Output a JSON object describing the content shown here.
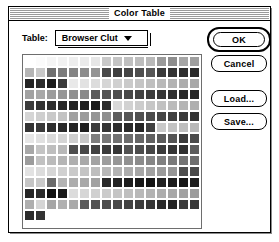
{
  "window": {
    "title": "Color Table"
  },
  "controls": {
    "table_label": "Table:",
    "popup_value": "Browser Clut",
    "popup_arrow_icon": "chevron-down-icon"
  },
  "buttons": {
    "ok": "OK",
    "cancel": "Cancel",
    "load": "Load...",
    "save": "Save..."
  },
  "colors": {
    "window_bg": "#ffffff",
    "frame": "#000000",
    "grid_border": "#6e6e6e",
    "titlebar_stripe": "#9b9b9b",
    "text": "#000000"
  },
  "swatch_grid": {
    "columns": 16,
    "rows": 15,
    "cell_size_px": 11,
    "total_swatches": 226,
    "palette_name": "Browser Clut",
    "values": [
      [
        "#ffffff",
        "#fbfbfb",
        "#f5f5f5",
        "#f2f2f2",
        "#eeeeee",
        "#ebebeb",
        "#e6e6e6",
        "#c9c9c9",
        "#c4c4c4",
        "#c0c0c0",
        "#bdbdbd",
        "#b9b9b9",
        "#9a9a9a",
        "#8e8e8e",
        "#a6a6a6",
        "#9f9f9f"
      ],
      [
        "#b5b5b5",
        "#c9c9c9",
        "#6f6f6f",
        "#7c7c7c",
        "#848484",
        "#8c8c8c",
        "#949494",
        "#4a4a4a",
        "#3f3f3f",
        "#464646",
        "#4e4e4e",
        "#565656",
        "#3a3a3a",
        "#343434",
        "#2f2f2f",
        "#2a2a2a"
      ],
      [
        "#242424",
        "#2c2c2c",
        "#1c1c1c",
        "#3b3b3b",
        "#e9e9e9",
        "#e2e2e2",
        "#dcdcdc",
        "#d6d6d6",
        "#d0d0d0",
        "#cacaca",
        "#c5c5c5",
        "#bfbfbf",
        "#b9b9b9",
        "#b3b3b3",
        "#adadad",
        "#a8a8a8"
      ],
      [
        "#a2a2a2",
        "#a9a9a9",
        "#9c9c9c",
        "#969696",
        "#909090",
        "#8a8a8a",
        "#5a5a5a",
        "#545454",
        "#4e4e4e",
        "#484848",
        "#434343",
        "#3d3d3d",
        "#373737",
        "#313131",
        "#2b2b2b",
        "#262626"
      ],
      [
        "#3c3c3c",
        "#333333",
        "#2e2e2e",
        "#292929",
        "#242424",
        "#1f1f1f",
        "#1a1a1a",
        "#2d2d2d",
        "#d8d8d8",
        "#d2d2d2",
        "#cccccc",
        "#c6c6c6",
        "#c1c1c1",
        "#bbbbbb",
        "#b5b5b5",
        "#afafaf"
      ],
      [
        "#d5d5d5",
        "#cfcfcf",
        "#c9c9c9",
        "#c3c3c3",
        "#a1a1a1",
        "#9b9b9b",
        "#959595",
        "#8f8f8f",
        "#5d5d5d",
        "#575757",
        "#515151",
        "#4c4c4c",
        "#464646",
        "#404040",
        "#3a3a3a",
        "#343434"
      ],
      [
        "#343434",
        "#3a3a3a",
        "#2f2f2f",
        "#2a2a2a",
        "#252525",
        "#202020",
        "#3b3b3b",
        "#353535",
        "#303030",
        "#2a2a2a",
        "#252525",
        "#404040",
        "#c9c9c9",
        "#c3c3c3",
        "#bebebe",
        "#b8b8b8"
      ],
      [
        "#e6e6e6",
        "#e0e0e0",
        "#dadada",
        "#d4d4d4",
        "#cecece",
        "#c8c8c8",
        "#7e7e7e",
        "#787878",
        "#727272",
        "#6c6c6c",
        "#666666",
        "#616161",
        "#5b5b5b",
        "#555555",
        "#3b3b3b",
        "#4b4b4b"
      ],
      [
        "#a8a8a8",
        "#c4c4c4",
        "#bebebe",
        "#b8b8b8",
        "#4d4d4d",
        "#474747",
        "#414141",
        "#3b3b3b",
        "#363636",
        "#525252",
        "#4c4c4c",
        "#464646",
        "#3b3b3b",
        "#353535",
        "#303030",
        "#5d5d5d"
      ],
      [
        "#9c9c9c",
        "#c1c1c1",
        "#bbbbbb",
        "#b5b5b5",
        "#afafaf",
        "#a9a9a9",
        "#a3a3a3",
        "#9d9d9d",
        "#979797",
        "#919191",
        "#8c8c8c",
        "#868686",
        "#808080",
        "#7a7a7a",
        "#747474",
        "#6e6e6e"
      ],
      [
        "#e2e2e2",
        "#dcdcdc",
        "#d6d6d6",
        "#d0d0d0",
        "#cacaca",
        "#c4c4c4",
        "#bebebe",
        "#b8b8b8",
        "#b3b3b3",
        "#adadad",
        "#a7a7a7",
        "#a1a1a1",
        "#9b9b9b",
        "#959595",
        "#4f4f4f",
        "#494949"
      ],
      [
        "#c5c5c5",
        "#c9c9c9",
        "#6a6a6a",
        "#b3b3b3",
        "#adadad",
        "#a8a8a8",
        "#a2a2a2",
        "#2a2a2a",
        "#242424",
        "#1e1e1e",
        "#181818",
        "#131313",
        "#222222",
        "#1c1c1c",
        "#171717",
        "#1e1e1e"
      ],
      [
        "#262626",
        "#2c2c2c",
        "#111111",
        "#1a1a1a",
        "#dcdcdc",
        "#d6d6d6",
        "#d0d0d0",
        "#cbcbcb",
        "#c5c5c5",
        "#bfbfbf",
        "#b9b9b9",
        "#b3b3b3",
        "#adadad",
        "#a8a8a8",
        "#a2a2a2",
        "#9c9c9c"
      ],
      [
        "#aeaeae",
        "#d5d5d5",
        "#a6a6a6",
        "#b0b0b0",
        "#aaaaaa",
        "#5a5a5a",
        "#545454",
        "#4e4e4e",
        "#494949",
        "#434343",
        "#3d3d3d",
        "#373737",
        "#2b2b2b",
        "#252525",
        "#3d3d3d",
        "#373737"
      ],
      [
        "#2b2b2b",
        "#333333"
      ]
    ]
  }
}
